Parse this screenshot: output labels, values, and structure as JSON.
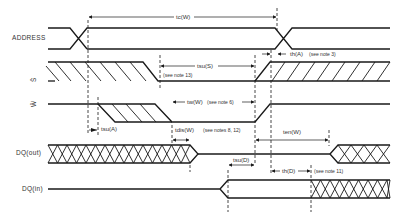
{
  "signals": {
    "address": "ADDRESS",
    "s_bar": "S̄",
    "w_bar": "W̄",
    "dq_out": "DQ(out)",
    "dq_in": "DQ(in)"
  },
  "timing_labels": {
    "tc_w": "tc(W)",
    "tsu_s": "tsu(S)",
    "tsu_s_note": "(see note 13)",
    "th_a": "th(A)",
    "th_a_note": "(see note 3)",
    "tw_w": "tw(W)",
    "tw_w_note": "(see note 6)",
    "tsu_a": "tsu(A)",
    "tdis_w": "tdis(W)",
    "tdis_w_note": "(see notes 8, 12)",
    "ten_w": "ten(W)",
    "tsu_d": "tsu(D)",
    "th_d": "th(D)",
    "th_d_note": "(see note 11)"
  }
}
